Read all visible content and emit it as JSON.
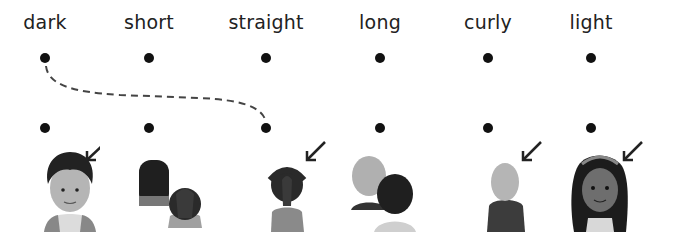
{
  "exercise": {
    "type": "match-words-to-pictures",
    "words": [
      {
        "label": "dark",
        "x": 45
      },
      {
        "label": "short",
        "x": 149
      },
      {
        "label": "straight",
        "x": 266
      },
      {
        "label": "long",
        "x": 380
      },
      {
        "label": "curly",
        "x": 488
      },
      {
        "label": "light",
        "x": 591
      }
    ],
    "pictures": [
      {
        "name": "boy-dark-spiky-hair-face",
        "x": 45,
        "arrow": true
      },
      {
        "name": "two-children-back-curly-and-short-dark-hair",
        "x": 149,
        "arrow": false
      },
      {
        "name": "child-back-dark-straight-hair",
        "x": 266,
        "arrow": true
      },
      {
        "name": "two-children-back-light-and-dark-hair",
        "x": 380,
        "arrow": false
      },
      {
        "name": "child-back-light-short-hair",
        "x": 488,
        "arrow": true
      },
      {
        "name": "girl-long-curly-dark-hair-face",
        "x": 591,
        "arrow": true
      }
    ],
    "example_connection": {
      "from_word": "dark",
      "to_picture": 2,
      "style": "dashed"
    }
  }
}
